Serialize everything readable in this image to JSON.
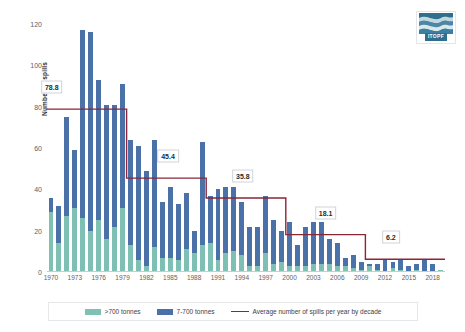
{
  "logo": {
    "name": "ITOPF",
    "wordmark": "ITOPF"
  },
  "chart_data": {
    "type": "bar",
    "subtype": "stacked-bar-with-step-line",
    "title": "",
    "xlabel": "",
    "ylabel": "Number of spills",
    "ylim": [
      0,
      120
    ],
    "yticks": [
      0,
      20,
      40,
      60,
      80,
      100,
      120
    ],
    "grid": false,
    "legend_position": "bottom",
    "categories": [
      "1970",
      "1971",
      "1972",
      "1973",
      "1974",
      "1975",
      "1976",
      "1977",
      "1978",
      "1979",
      "1980",
      "1981",
      "1982",
      "1983",
      "1984",
      "1985",
      "1986",
      "1987",
      "1988",
      "1989",
      "1990",
      "1991",
      "1992",
      "1993",
      "1994",
      "1995",
      "1996",
      "1997",
      "1998",
      "1999",
      "2000",
      "2001",
      "2002",
      "2003",
      "2004",
      "2005",
      "2006",
      "2007",
      "2008",
      "2009",
      "2010",
      "2011",
      "2012",
      "2013",
      "2014",
      "2015",
      "2016",
      "2017",
      "2018",
      "2019"
    ],
    "xtick_labels": [
      "1970",
      "1973",
      "1976",
      "1979",
      "1982",
      "1985",
      "1988",
      "1991",
      "1994",
      "1997",
      "2000",
      "2003",
      "2006",
      "2009",
      "2012",
      "2015",
      "2018"
    ],
    "series": [
      {
        "name": ">700 tonnes",
        "color": "#7fc0b5",
        "values": [
          29,
          14,
          27,
          31,
          26,
          20,
          25,
          16,
          22,
          31,
          13,
          6,
          3,
          12,
          7,
          7,
          6,
          11,
          9,
          13,
          14,
          6,
          9,
          10,
          8,
          3,
          3,
          9,
          4,
          5,
          3,
          3,
          3,
          4,
          4,
          4,
          3,
          3,
          2,
          1,
          3,
          1,
          0,
          2,
          1,
          0,
          1,
          0,
          0,
          1
        ]
      },
      {
        "name": "7-700 tonnes",
        "color": "#4a72a8",
        "values": [
          7,
          18,
          48,
          28,
          91,
          96,
          68,
          65,
          59,
          60,
          51,
          55,
          46,
          52,
          27,
          34,
          27,
          27,
          11,
          50,
          23,
          34,
          32,
          31,
          26,
          19,
          19,
          28,
          21,
          15,
          21,
          10,
          19,
          20,
          20,
          12,
          11,
          4,
          6,
          4,
          1,
          3,
          6,
          3,
          5,
          3,
          3,
          6,
          4,
          0
        ]
      }
    ],
    "totals": [
      36,
      32,
      75,
      59,
      117,
      116,
      93,
      81,
      81,
      91,
      64,
      61,
      49,
      64,
      34,
      41,
      33,
      38,
      20,
      63,
      37,
      40,
      41,
      41,
      34,
      22,
      22,
      37,
      25,
      20,
      24,
      13,
      22,
      24,
      24,
      16,
      14,
      7,
      8,
      5,
      4,
      4,
      6,
      5,
      6,
      3,
      4,
      6,
      4,
      1
    ],
    "average_line": {
      "name": "Average number of spills per year by decade",
      "color": "#8b2638",
      "steps": [
        {
          "label": "78.8",
          "value": 78.8,
          "start_year": "1970",
          "end_year": "1979"
        },
        {
          "label": "45.4",
          "value": 45.4,
          "start_year": "1980",
          "end_year": "1989"
        },
        {
          "label": "35.8",
          "value": 35.8,
          "start_year": "1990",
          "end_year": "1999"
        },
        {
          "label": "18.1",
          "value": 18.1,
          "start_year": "2000",
          "end_year": "2009"
        },
        {
          "label": "6.2",
          "value": 6.2,
          "start_year": "2010",
          "end_year": "2019"
        }
      ]
    },
    "legend": [
      {
        "label": ">700 tonnes",
        "color": "#7fc0b5",
        "marker": "square"
      },
      {
        "label": "7-700 tonnes",
        "color": "#4a72a8",
        "marker": "square"
      },
      {
        "label": "Average number of spills per year by decade",
        "color": "#8b2638",
        "marker": "line"
      }
    ]
  }
}
